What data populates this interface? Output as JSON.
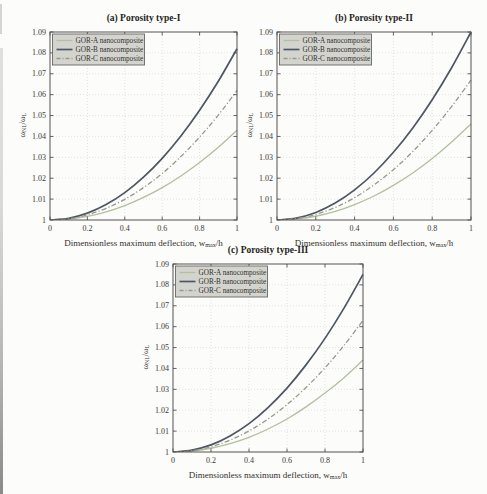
{
  "page": {
    "background": "#fcfcfa"
  },
  "figure": {
    "axis_labels": {
      "x_prefix": "Dimensionless maximum deflection, w",
      "x_sub": "max",
      "x_suffix": "/h",
      "y_prefix": "ω",
      "y_sub_nl": "NL",
      "y_mid": "/ω",
      "y_sub_l": "L"
    },
    "legend_labels": [
      "GOR-A nanocomposite",
      "GOR-B nanocomposite",
      "GOR-C nanocomposite"
    ],
    "colors": {
      "gor_a": "#b3bfa0",
      "gor_b": "#4d5662",
      "gor_c": "#98988c",
      "axis": "#555250",
      "grid": "#d8d8d2",
      "legend_fill": "#d4d4cf",
      "legend_border": "#6a6762",
      "text": "#3b3936"
    }
  },
  "chart_data": [
    {
      "type": "line",
      "title": "(a) Porosity type-I",
      "xlabel": "Dimensionless maximum deflection, w_max/h",
      "ylabel": "ω_NL/ω_L",
      "xlim": [
        0,
        1
      ],
      "ylim": [
        1,
        1.09
      ],
      "xticks": [
        0,
        0.2,
        0.4,
        0.6,
        0.8,
        1
      ],
      "xtick_labels": [
        "0",
        "0.2",
        "0.4",
        "0.6",
        "0.8",
        "1"
      ],
      "yticks": [
        1,
        1.01,
        1.02,
        1.03,
        1.04,
        1.05,
        1.06,
        1.07,
        1.08,
        1.09
      ],
      "ytick_labels": [
        "1",
        "1.01",
        "1.02",
        "1.03",
        "1.04",
        "1.05",
        "1.06",
        "1.07",
        "1.08",
        "1.09"
      ],
      "grid": true,
      "legend_position": "top-left",
      "x": [
        0,
        0.1,
        0.2,
        0.3,
        0.4,
        0.5,
        0.6,
        0.7,
        0.8,
        0.9,
        1
      ],
      "series": [
        {
          "name": "GOR-A nanocomposite",
          "color": "#b3bfa0",
          "style": "solid",
          "width": 1.3,
          "values": [
            1,
            1.0004,
            1.0017,
            1.0039,
            1.0069,
            1.0108,
            1.0155,
            1.0211,
            1.0275,
            1.0348,
            1.043
          ]
        },
        {
          "name": "GOR-B nanocomposite",
          "color": "#4d5662",
          "style": "solid",
          "width": 1.7,
          "values": [
            1,
            1.0008,
            1.0033,
            1.0074,
            1.0131,
            1.0205,
            1.0295,
            1.0402,
            1.0525,
            1.0664,
            1.082
          ]
        },
        {
          "name": "GOR-C nanocomposite",
          "color": "#98988c",
          "style": "dashdot",
          "width": 1.3,
          "values": [
            1,
            1.0006,
            1.0025,
            1.0056,
            1.0099,
            1.0155,
            1.0223,
            1.0304,
            1.0397,
            1.0502,
            1.062
          ]
        }
      ]
    },
    {
      "type": "line",
      "title": "(b) Porosity type-II",
      "xlabel": "Dimensionless maximum deflection, w_max/h",
      "ylabel": "ω_NL/ω_L",
      "xlim": [
        0,
        1
      ],
      "ylim": [
        1,
        1.09
      ],
      "xticks": [
        0,
        0.2,
        0.4,
        0.6,
        0.8,
        1
      ],
      "xtick_labels": [
        "0",
        "0.2",
        "0.4",
        "0.6",
        "0.8",
        "1"
      ],
      "yticks": [
        1,
        1.01,
        1.02,
        1.03,
        1.04,
        1.05,
        1.06,
        1.07,
        1.08,
        1.09
      ],
      "ytick_labels": [
        "1",
        "1.01",
        "1.02",
        "1.03",
        "1.04",
        "1.05",
        "1.06",
        "1.07",
        "1.08",
        "1.09"
      ],
      "grid": true,
      "legend_position": "top-left",
      "x": [
        0,
        0.1,
        0.2,
        0.3,
        0.4,
        0.5,
        0.6,
        0.7,
        0.8,
        0.9,
        1
      ],
      "series": [
        {
          "name": "GOR-A nanocomposite",
          "color": "#b3bfa0",
          "style": "solid",
          "width": 1.3,
          "values": [
            1,
            1.0005,
            1.0018,
            1.0041,
            1.0074,
            1.0115,
            1.0166,
            1.0225,
            1.0294,
            1.0373,
            1.046
          ]
        },
        {
          "name": "GOR-B nanocomposite",
          "color": "#4d5662",
          "style": "solid",
          "width": 1.7,
          "values": [
            1,
            1.0009,
            1.0036,
            1.0081,
            1.0144,
            1.0225,
            1.0324,
            1.0441,
            1.0576,
            1.0729,
            1.09
          ]
        },
        {
          "name": "GOR-C nanocomposite",
          "color": "#98988c",
          "style": "dashdot",
          "width": 1.3,
          "values": [
            1,
            1.0007,
            1.0027,
            1.006,
            1.0107,
            1.0168,
            1.0241,
            1.0328,
            1.0429,
            1.0543,
            1.067
          ]
        }
      ]
    },
    {
      "type": "line",
      "title": "(c) Porosity type-III",
      "xlabel": "Dimensionless maximum deflection, w_max/h",
      "ylabel": "ω_NL/ω_L",
      "xlim": [
        0,
        1
      ],
      "ylim": [
        1,
        1.09
      ],
      "xticks": [
        0,
        0.2,
        0.4,
        0.6,
        0.8,
        1
      ],
      "xtick_labels": [
        "0",
        "0.2",
        "0.4",
        "0.6",
        "0.8",
        "1"
      ],
      "yticks": [
        1,
        1.01,
        1.02,
        1.03,
        1.04,
        1.05,
        1.06,
        1.07,
        1.08,
        1.09
      ],
      "ytick_labels": [
        "1",
        "1.01",
        "1.02",
        "1.03",
        "1.04",
        "1.05",
        "1.06",
        "1.07",
        "1.08",
        "1.09"
      ],
      "grid": true,
      "legend_position": "top-left",
      "x": [
        0,
        0.1,
        0.2,
        0.3,
        0.4,
        0.5,
        0.6,
        0.7,
        0.8,
        0.9,
        1
      ],
      "series": [
        {
          "name": "GOR-A nanocomposite",
          "color": "#b3bfa0",
          "style": "solid",
          "width": 1.3,
          "values": [
            1,
            1.0004,
            1.0018,
            1.004,
            1.007,
            1.011,
            1.0158,
            1.0216,
            1.0282,
            1.0356,
            1.044
          ]
        },
        {
          "name": "GOR-B nanocomposite",
          "color": "#4d5662",
          "style": "solid",
          "width": 1.7,
          "values": [
            1,
            1.0009,
            1.0034,
            1.0077,
            1.0136,
            1.0213,
            1.0306,
            1.0417,
            1.0544,
            1.0689,
            1.085
          ]
        },
        {
          "name": "GOR-C nanocomposite",
          "color": "#98988c",
          "style": "dashdot",
          "width": 1.3,
          "values": [
            1,
            1.0006,
            1.0025,
            1.0057,
            1.0101,
            1.0158,
            1.0227,
            1.0309,
            1.0403,
            1.051,
            1.063
          ]
        }
      ]
    }
  ]
}
